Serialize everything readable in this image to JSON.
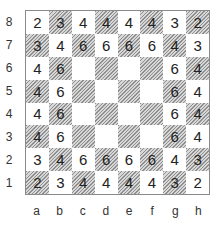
{
  "board": {
    "ranks": [
      "8",
      "7",
      "6",
      "5",
      "4",
      "3",
      "2",
      "1"
    ],
    "files": [
      "a",
      "b",
      "c",
      "d",
      "e",
      "f",
      "g",
      "h"
    ],
    "rows": [
      [
        "2",
        "3",
        "4",
        "4",
        "4",
        "4",
        "3",
        "2"
      ],
      [
        "3",
        "4",
        "6",
        "6",
        "6",
        "6",
        "4",
        "3"
      ],
      [
        "4",
        "6",
        "",
        "",
        "",
        "",
        "6",
        "4"
      ],
      [
        "4",
        "6",
        "",
        "",
        "",
        "",
        "6",
        "4"
      ],
      [
        "4",
        "6",
        "",
        "",
        "",
        "",
        "6",
        "4"
      ],
      [
        "4",
        "6",
        "",
        "",
        "",
        "",
        "6",
        "4"
      ],
      [
        "3",
        "4",
        "6",
        "6",
        "6",
        "6",
        "4",
        "3"
      ],
      [
        "2",
        "3",
        "4",
        "4",
        "4",
        "4",
        "3",
        "2"
      ]
    ],
    "colors": {
      "light": "#ffffff",
      "dark_hatch": "#9a9a9a",
      "border": "#8a8a8a",
      "text": "#222222"
    }
  }
}
